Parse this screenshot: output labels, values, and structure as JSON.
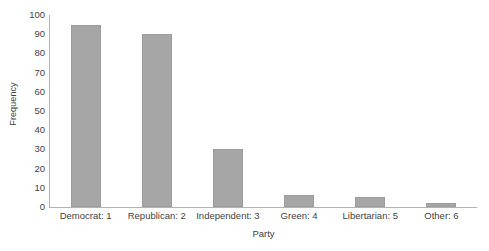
{
  "chart_data": {
    "type": "bar",
    "title": "",
    "xlabel": "Party",
    "ylabel": "Frequency",
    "categories": [
      "Democrat: 1",
      "Republican: 2",
      "Independent: 3",
      "Green: 4",
      "Libertarian: 5",
      "Other: 6"
    ],
    "values": [
      95,
      90,
      30,
      6,
      5,
      2
    ],
    "ylim": [
      0,
      100
    ],
    "ytick_labels": [
      "100",
      "90",
      "80",
      "70",
      "60",
      "50",
      "40",
      "30",
      "20",
      "10",
      "0"
    ],
    "ytick_values": [
      100,
      90,
      80,
      70,
      60,
      50,
      40,
      30,
      20,
      10,
      0
    ],
    "grid": false,
    "legend": false,
    "bar_color": "#a6a6a6",
    "axis_color": "#b3b3b3",
    "text_color": "#3f3f3f",
    "background": "#ffffff"
  }
}
